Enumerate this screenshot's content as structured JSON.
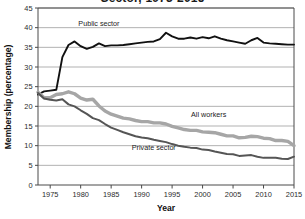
{
  "chart_data": {
    "type": "line",
    "title": "Sector, 1973-2015",
    "xlabel": "Year",
    "ylabel": "Membership (percentage)",
    "xlim": [
      1973,
      2015
    ],
    "ylim": [
      0,
      45
    ],
    "ytick_step": 5,
    "xtick_step": 5,
    "xticks": [
      1975,
      1980,
      1985,
      1990,
      1995,
      2000,
      2005,
      2010,
      2015
    ],
    "yticks": [
      0,
      5,
      10,
      15,
      20,
      25,
      30,
      35,
      40,
      45
    ],
    "grid": "horizontal",
    "legend": "inline-annotations",
    "x": [
      1973,
      1974,
      1975,
      1976,
      1977,
      1978,
      1979,
      1980,
      1981,
      1982,
      1983,
      1984,
      1985,
      1986,
      1987,
      1988,
      1989,
      1990,
      1991,
      1992,
      1993,
      1994,
      1995,
      1996,
      1997,
      1998,
      1999,
      2000,
      2001,
      2002,
      2003,
      2004,
      2005,
      2006,
      2007,
      2008,
      2009,
      2010,
      2011,
      2012,
      2013,
      2014,
      2015
    ],
    "series": [
      {
        "name": "Public sector",
        "color": "#111111",
        "width": 1.9,
        "label_x": 1983,
        "label_y": 40.3,
        "values": [
          23.0,
          23.8,
          24.0,
          24.2,
          32.5,
          35.6,
          36.5,
          35.3,
          34.6,
          35.1,
          36.0,
          35.3,
          35.5,
          35.5,
          35.6,
          35.8,
          36.0,
          36.2,
          36.4,
          36.5,
          37.1,
          38.7,
          37.8,
          37.2,
          37.2,
          37.5,
          37.2,
          37.6,
          37.3,
          37.8,
          37.2,
          36.8,
          36.5,
          36.2,
          35.9,
          36.8,
          37.4,
          36.2,
          36.0,
          35.9,
          35.8,
          35.7,
          35.7
        ]
      },
      {
        "name": "All workers",
        "color": "#a6a6a6",
        "width": 3.4,
        "label_x": 2001,
        "label_y": 17.4,
        "values": [
          23.6,
          22.2,
          22.2,
          23.0,
          23.2,
          23.7,
          23.2,
          22.1,
          21.6,
          21.8,
          20.1,
          18.8,
          18.0,
          17.5,
          17.0,
          16.8,
          16.4,
          16.1,
          16.1,
          15.8,
          15.8,
          15.5,
          14.9,
          14.5,
          14.1,
          13.9,
          13.9,
          13.5,
          13.4,
          13.3,
          12.9,
          12.5,
          12.5,
          12.0,
          12.1,
          12.4,
          12.3,
          11.9,
          11.8,
          11.3,
          11.3,
          11.1,
          10.0
        ]
      },
      {
        "name": "Private sector",
        "color": "#555555",
        "width": 2.0,
        "label_x": 1992,
        "label_y": 8.8,
        "values": [
          23.4,
          22.0,
          21.7,
          21.5,
          21.8,
          20.5,
          20.0,
          19.0,
          18.1,
          17.0,
          16.5,
          15.5,
          14.6,
          14.0,
          13.4,
          12.9,
          12.4,
          12.1,
          11.9,
          11.5,
          11.2,
          10.9,
          10.4,
          10.0,
          9.7,
          9.5,
          9.4,
          9.0,
          8.9,
          8.5,
          8.2,
          7.9,
          7.8,
          7.4,
          7.5,
          7.6,
          7.2,
          6.9,
          6.9,
          6.9,
          6.7,
          6.6,
          7.2
        ]
      }
    ]
  }
}
